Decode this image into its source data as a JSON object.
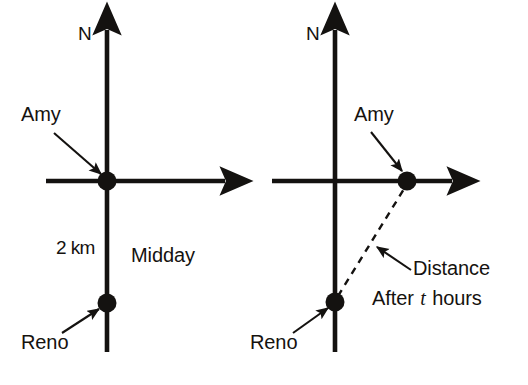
{
  "figure": {
    "stroke_color": "#141210",
    "dash_color": "#141210",
    "background": "#ffffff",
    "panels": [
      {
        "id": "left-panel",
        "caption": "Midday",
        "labels": {
          "north": "N",
          "amy": "Amy",
          "reno": "Reno",
          "separation": "2 km",
          "time": "Midday"
        }
      },
      {
        "id": "right-panel",
        "caption": "After t hours",
        "labels": {
          "north": "N",
          "amy": "Amy",
          "reno": "Reno",
          "distance": "Distance",
          "time_prefix": "After",
          "time_variable": "t",
          "time_suffix": "hours"
        }
      }
    ]
  }
}
